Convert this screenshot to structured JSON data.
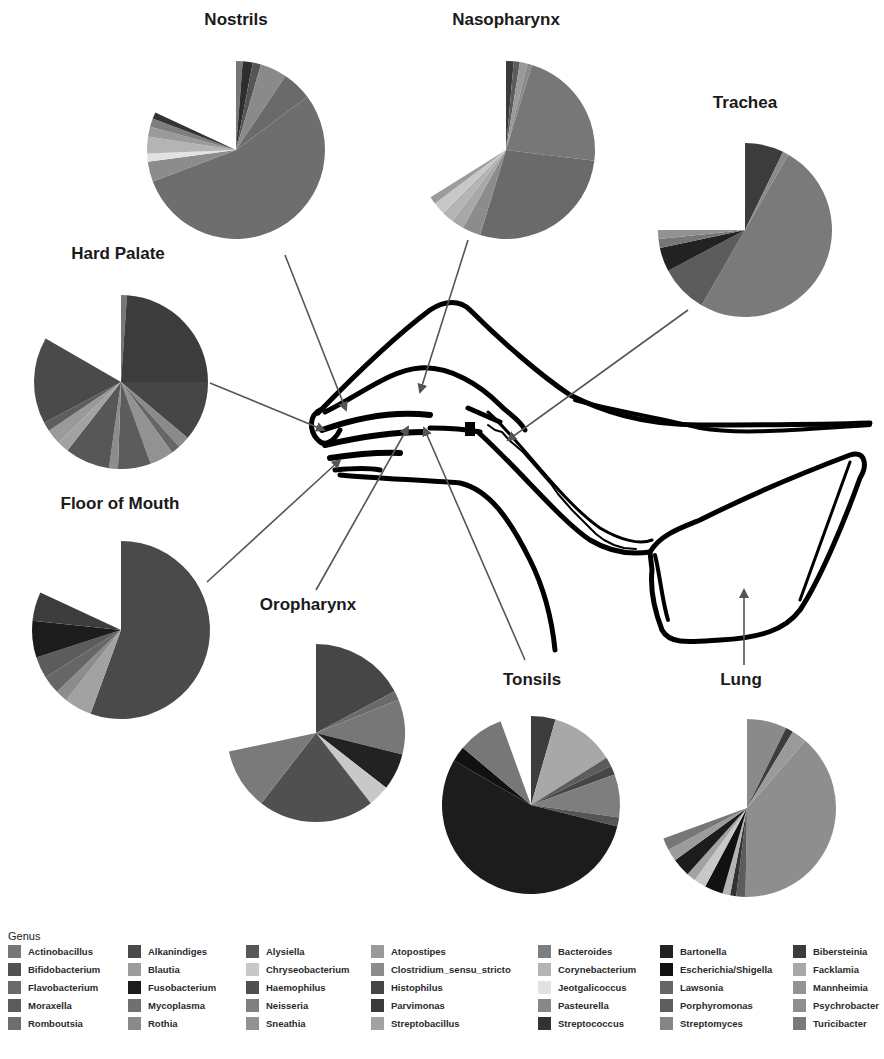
{
  "chart_data": {
    "type": "pie",
    "legend": {
      "title": "Genus",
      "entries": [
        {
          "name": "Actinobacillus",
          "color": "#777777"
        },
        {
          "name": "Alkanindiges",
          "color": "#4a4a4a"
        },
        {
          "name": "Alysiella",
          "color": "#575757"
        },
        {
          "name": "Atopostipes",
          "color": "#9a9a9a"
        },
        {
          "name": "Bacteroides",
          "color": "#7e7e7e"
        },
        {
          "name": "Bartonella",
          "color": "#222222"
        },
        {
          "name": "Bibersteinia",
          "color": "#3c3c3c"
        },
        {
          "name": "Bifidobacterium",
          "color": "#525252"
        },
        {
          "name": "Blautia",
          "color": "#9c9c9c"
        },
        {
          "name": "Chryseobacterium",
          "color": "#c8c8c8"
        },
        {
          "name": "Clostridium_sensu_stricto",
          "color": "#8c8c8c"
        },
        {
          "name": "Corynebacterium",
          "color": "#b4b4b4"
        },
        {
          "name": "Escherichia/Shigella",
          "color": "#111111"
        },
        {
          "name": "Facklamia",
          "color": "#a8a8a8"
        },
        {
          "name": "Flavobacterium",
          "color": "#6a6a6a"
        },
        {
          "name": "Fusobacterium",
          "color": "#1c1c1c"
        },
        {
          "name": "Haemophilus",
          "color": "#505050"
        },
        {
          "name": "Histophilus",
          "color": "#464646"
        },
        {
          "name": "Jeotgalicoccus",
          "color": "#e2e2e2"
        },
        {
          "name": "Lawsonia",
          "color": "#666666"
        },
        {
          "name": "Mannheimia",
          "color": "#939393"
        },
        {
          "name": "Moraxella",
          "color": "#5c5c5c"
        },
        {
          "name": "Mycoplasma",
          "color": "#707070"
        },
        {
          "name": "Neisseria",
          "color": "#808080"
        },
        {
          "name": "Parvimonas",
          "color": "#3a3a3a"
        },
        {
          "name": "Pasteurella",
          "color": "#888888"
        },
        {
          "name": "Porphyromonas",
          "color": "#5e5e5e"
        },
        {
          "name": "Psychrobacter",
          "color": "#8e8e8e"
        },
        {
          "name": "Romboutsia",
          "color": "#6e6e6e"
        },
        {
          "name": "Rothia",
          "color": "#8a8a8a"
        },
        {
          "name": "Sneathia",
          "color": "#929292"
        },
        {
          "name": "Streptobacillus",
          "color": "#a2a2a2"
        },
        {
          "name": "Streptococcus",
          "color": "#333333"
        },
        {
          "name": "Streptomyces",
          "color": "#858585"
        },
        {
          "name": "Turicibacter",
          "color": "#7a7a7a"
        }
      ]
    },
    "pies": [
      {
        "name": "Nostrils",
        "cx": 236,
        "cy": 150,
        "r": 89,
        "title_x": 236,
        "title_y": 10,
        "coverage_deg": 295,
        "slices": [
          {
            "color": "#777777",
            "deg": 4
          },
          {
            "color": "#2e2e2e",
            "deg": 6
          },
          {
            "color": "#555555",
            "deg": 5
          },
          {
            "color": "#8a8a8a",
            "deg": 16
          },
          {
            "color": "#6a6a6a",
            "deg": 18
          },
          {
            "color": "#6e6e6e",
            "deg": 180
          },
          {
            "color": "#8c8c8c",
            "deg": 12
          },
          {
            "color": "#e2e2e2",
            "deg": 5
          },
          {
            "color": "#b4b4b4",
            "deg": 10
          },
          {
            "color": "#9a9a9a",
            "deg": 6
          },
          {
            "color": "#7e7e7e",
            "deg": 5
          },
          {
            "color": "#333333",
            "deg": 4
          }
        ]
      },
      {
        "name": "Nasopharynx",
        "cx": 506,
        "cy": 150,
        "r": 89,
        "title_x": 506,
        "title_y": 10,
        "coverage_deg": 238,
        "slices": [
          {
            "color": "#3a3a3a",
            "deg": 5
          },
          {
            "color": "#5c5c5c",
            "deg": 4
          },
          {
            "color": "#9a9a9a",
            "deg": 5
          },
          {
            "color": "#8a8a8a",
            "deg": 3
          },
          {
            "color": "#777777",
            "deg": 80
          },
          {
            "color": "#6a6a6a",
            "deg": 100
          },
          {
            "color": "#8c8c8c",
            "deg": 12
          },
          {
            "color": "#a8a8a8",
            "deg": 8
          },
          {
            "color": "#b4b4b4",
            "deg": 8
          },
          {
            "color": "#c8c8c8",
            "deg": 8
          },
          {
            "color": "#9c9c9c",
            "deg": 5
          }
        ]
      },
      {
        "name": "Trachea",
        "cx": 745,
        "cy": 230,
        "r": 87,
        "title_x": 745,
        "title_y": 93,
        "coverage_deg": 270,
        "slices": [
          {
            "color": "#3c3c3c",
            "deg": 26
          },
          {
            "color": "#8a8a8a",
            "deg": 4
          },
          {
            "color": "#7a7a7a",
            "deg": 180
          },
          {
            "color": "#5c5c5c",
            "deg": 32
          },
          {
            "color": "#222222",
            "deg": 16
          },
          {
            "color": "#777777",
            "deg": 6
          },
          {
            "color": "#929292",
            "deg": 6
          }
        ]
      },
      {
        "name": "Hard Palate",
        "cx": 121,
        "cy": 382,
        "r": 87,
        "title_x": 118,
        "title_y": 244,
        "coverage_deg": 300,
        "slices": [
          {
            "color": "#777777",
            "deg": 4
          },
          {
            "color": "#3c3c3c",
            "deg": 86
          },
          {
            "color": "#464646",
            "deg": 40
          },
          {
            "color": "#8a8a8a",
            "deg": 8
          },
          {
            "color": "#666666",
            "deg": 6
          },
          {
            "color": "#929292",
            "deg": 16
          },
          {
            "color": "#5c5c5c",
            "deg": 22
          },
          {
            "color": "#8c8c8c",
            "deg": 6
          },
          {
            "color": "#575757",
            "deg": 30
          },
          {
            "color": "#a2a2a2",
            "deg": 8
          },
          {
            "color": "#9a9a9a",
            "deg": 10
          },
          {
            "color": "#5e5e5e",
            "deg": 6
          },
          {
            "color": "#4a4a4a",
            "deg": 58
          }
        ]
      },
      {
        "name": "Floor of Mouth",
        "cx": 121,
        "cy": 630,
        "r": 89,
        "title_x": 120,
        "title_y": 494,
        "coverage_deg": 295,
        "slices": [
          {
            "color": "#4a4a4a",
            "deg": 200
          },
          {
            "color": "#a2a2a2",
            "deg": 18
          },
          {
            "color": "#8c8c8c",
            "deg": 8
          },
          {
            "color": "#666666",
            "deg": 12
          },
          {
            "color": "#5c5c5c",
            "deg": 14
          },
          {
            "color": "#1c1c1c",
            "deg": 24
          },
          {
            "color": "#3c3c3c",
            "deg": 19
          }
        ]
      },
      {
        "name": "Oropharynx",
        "cx": 316,
        "cy": 733,
        "r": 89,
        "title_x": 308,
        "title_y": 595,
        "coverage_deg": 258,
        "slices": [
          {
            "color": "#464646",
            "deg": 62
          },
          {
            "color": "#6a6a6a",
            "deg": 6
          },
          {
            "color": "#777777",
            "deg": 36
          },
          {
            "color": "#222222",
            "deg": 24
          },
          {
            "color": "#c8c8c8",
            "deg": 14
          },
          {
            "color": "#505050",
            "deg": 76
          },
          {
            "color": "#7a7a7a",
            "deg": 40
          }
        ]
      },
      {
        "name": "Tonsils",
        "cx": 531,
        "cy": 805,
        "r": 89,
        "title_x": 532,
        "title_y": 670,
        "coverage_deg": 340,
        "slices": [
          {
            "color": "#3c3c3c",
            "deg": 16
          },
          {
            "color": "#a8a8a8",
            "deg": 42
          },
          {
            "color": "#5c5c5c",
            "deg": 6
          },
          {
            "color": "#464646",
            "deg": 6
          },
          {
            "color": "#7e7e7e",
            "deg": 28
          },
          {
            "color": "#555555",
            "deg": 6
          },
          {
            "color": "#1c1c1c",
            "deg": 196
          },
          {
            "color": "#111111",
            "deg": 10
          },
          {
            "color": "#777777",
            "deg": 30
          }
        ]
      },
      {
        "name": "Lung",
        "cx": 747,
        "cy": 808,
        "r": 89,
        "title_x": 741,
        "title_y": 670,
        "coverage_deg": 250,
        "slices": [
          {
            "color": "#8a8a8a",
            "deg": 26
          },
          {
            "color": "#3c3c3c",
            "deg": 5
          },
          {
            "color": "#9a9a9a",
            "deg": 10
          },
          {
            "color": "#8e8e8e",
            "deg": 140
          },
          {
            "color": "#5c5c5c",
            "deg": 6
          },
          {
            "color": "#333333",
            "deg": 4
          },
          {
            "color": "#b4b4b4",
            "deg": 5
          },
          {
            "color": "#111111",
            "deg": 12
          },
          {
            "color": "#c8c8c8",
            "deg": 8
          },
          {
            "color": "#a2a2a2",
            "deg": 6
          },
          {
            "color": "#1c1c1c",
            "deg": 12
          },
          {
            "color": "#9c9c9c",
            "deg": 8
          },
          {
            "color": "#777777",
            "deg": 8
          }
        ]
      }
    ],
    "arrows": [
      {
        "site": "Nostrils",
        "x1": 285,
        "y1": 255,
        "x2": 346,
        "y2": 410
      },
      {
        "site": "Nasopharynx",
        "x1": 468,
        "y1": 240,
        "x2": 420,
        "y2": 392
      },
      {
        "site": "Trachea",
        "x1": 688,
        "y1": 310,
        "x2": 508,
        "y2": 440
      },
      {
        "site": "Hard Palate",
        "x1": 210,
        "y1": 383,
        "x2": 324,
        "y2": 430
      },
      {
        "site": "Floor of Mouth",
        "x1": 207,
        "y1": 582,
        "x2": 340,
        "y2": 460
      },
      {
        "site": "Oropharynx",
        "x1": 316,
        "y1": 590,
        "x2": 408,
        "y2": 427
      },
      {
        "site": "Tonsils",
        "x1": 525,
        "y1": 660,
        "x2": 424,
        "y2 ": 428,
        "y2": 428
      },
      {
        "site": "Lung",
        "x1": 744,
        "y1": 665,
        "x2": 744,
        "y2": 590
      }
    ]
  }
}
